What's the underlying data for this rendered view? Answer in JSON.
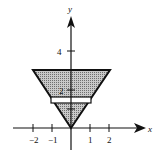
{
  "figure": {
    "axes": {
      "x_label": "x",
      "y_label": "y",
      "x_ticks": [
        {
          "value": -2,
          "label": "−2"
        },
        {
          "value": -1,
          "label": "−1"
        },
        {
          "value": 1,
          "label": "1"
        },
        {
          "value": 2,
          "label": "2"
        }
      ],
      "y_ticks": [
        {
          "value": 1,
          "label": ""
        },
        {
          "value": 2,
          "label": "2"
        },
        {
          "value": 4,
          "label": "4"
        }
      ]
    },
    "region": {
      "shape": "inverted-triangle",
      "vertices": [
        [
          0,
          0
        ],
        [
          -2,
          3
        ],
        [
          2,
          3
        ]
      ],
      "fill": "#a8a8a8"
    },
    "slice": {
      "y_bottom": 1.3,
      "y_top": 1.6,
      "x_left": -1.05,
      "x_right": 1.05,
      "fill": "#ffffff"
    },
    "colors": {
      "stroke": "#111111",
      "shade": "#a8a8a8"
    }
  }
}
